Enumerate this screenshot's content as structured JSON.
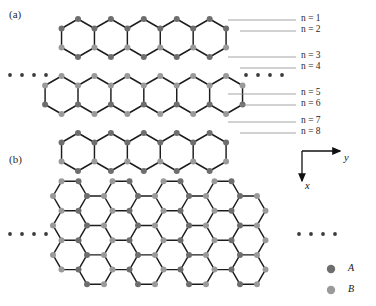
{
  "figure": {
    "panels": [
      {
        "id": "a",
        "label": "(a)",
        "type": "lattice-pointy-top",
        "description": "honeycomb nanoribbon, 3 rows of pointy-top hexagons, periodic along y",
        "rows": 3,
        "cols": 6
      },
      {
        "id": "b",
        "label": "(b)",
        "type": "lattice-flat-top",
        "description": "honeycomb nanoribbon, 3 rows of flat-top hexagons, periodic along y",
        "rows": 3,
        "cols": 6
      }
    ],
    "index_labels": [
      {
        "text": "n = 1",
        "n": 1
      },
      {
        "text": "n = 2",
        "n": 2
      },
      {
        "text": "n = 3",
        "n": 3
      },
      {
        "text": "n = 4",
        "n": 4
      },
      {
        "text": "n = 5",
        "n": 5
      },
      {
        "text": "n = 6",
        "n": 6
      },
      {
        "text": "n = 7",
        "n": 7
      },
      {
        "text": "n = 8",
        "n": 8
      }
    ],
    "axes": {
      "horizontal": "y",
      "vertical": "x"
    },
    "legend": [
      {
        "key": "A",
        "label": "A",
        "color": "#6e6e6e"
      },
      {
        "key": "B",
        "label": "B",
        "color": "#9a9a9a"
      }
    ],
    "ellipsis": {
      "glyph": "•",
      "count": 4
    },
    "colors": {
      "site_a": "#6e6e6e",
      "site_b": "#9a9a9a",
      "bond": "#1c1c1c",
      "leader": "#8d8d8d",
      "axis": "#111111",
      "background": "#ffffff"
    }
  }
}
